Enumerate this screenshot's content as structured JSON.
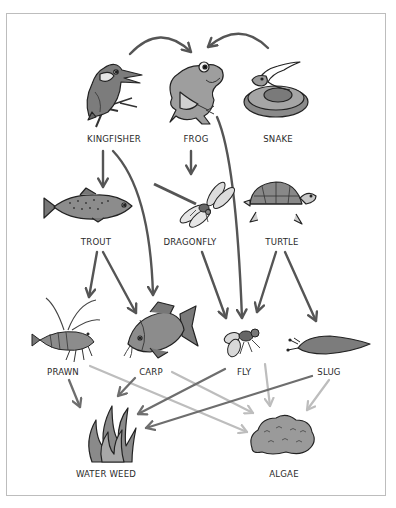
{
  "diagram": {
    "colors": {
      "arrow_dark": "#555555",
      "arrow_mid": "#6e6e6e",
      "arrow_light": "#bdbdbd",
      "border": "#bdbdbd",
      "organism_fill": "#8f8f8f",
      "organism_light": "#c8c8c8",
      "outline": "#222222"
    },
    "nodes": [
      {
        "id": "kingfisher",
        "label": "KINGFISHER",
        "icon": "kingfisher-icon",
        "x": 114,
        "y": 138
      },
      {
        "id": "frog",
        "label": "FROG",
        "icon": "frog-icon",
        "x": 196,
        "y": 138
      },
      {
        "id": "snake",
        "label": "SNAKE",
        "icon": "snake-icon",
        "x": 278,
        "y": 138
      },
      {
        "id": "trout",
        "label": "TROUT",
        "icon": "trout-icon",
        "x": 96,
        "y": 241
      },
      {
        "id": "dragonfly",
        "label": "DRAGONFLY",
        "icon": "dragonfly-icon",
        "x": 190,
        "y": 241
      },
      {
        "id": "turtle",
        "label": "TURTLE",
        "icon": "turtle-icon",
        "x": 282,
        "y": 241
      },
      {
        "id": "prawn",
        "label": "PRAWN",
        "icon": "prawn-icon",
        "x": 63,
        "y": 371
      },
      {
        "id": "carp",
        "label": "CARP",
        "icon": "carp-icon",
        "x": 151,
        "y": 371
      },
      {
        "id": "fly",
        "label": "FLY",
        "icon": "fly-icon",
        "x": 244,
        "y": 371
      },
      {
        "id": "slug",
        "label": "SLUG",
        "icon": "slug-icon",
        "x": 329,
        "y": 371
      },
      {
        "id": "water_weed",
        "label": "WATER WEED",
        "icon": "water-weed-icon",
        "x": 106,
        "y": 473
      },
      {
        "id": "algae",
        "label": "ALGAE",
        "icon": "algae-icon",
        "x": 284,
        "y": 473
      }
    ],
    "edges": [
      {
        "from": "kingfisher",
        "to": "frog",
        "shade": "dark"
      },
      {
        "from": "snake",
        "to": "frog",
        "shade": "dark"
      },
      {
        "from": "kingfisher",
        "to": "trout",
        "shade": "dark"
      },
      {
        "from": "kingfisher",
        "to": "carp",
        "shade": "dark"
      },
      {
        "from": "frog",
        "to": "dragonfly",
        "shade": "dark"
      },
      {
        "from": "frog",
        "to": "fly",
        "shade": "dark"
      },
      {
        "from": "trout",
        "to": "prawn",
        "shade": "dark"
      },
      {
        "from": "trout",
        "to": "carp",
        "shade": "dark"
      },
      {
        "from": "dragonfly",
        "to": "fly",
        "shade": "dark"
      },
      {
        "from": "turtle",
        "to": "fly",
        "shade": "dark"
      },
      {
        "from": "turtle",
        "to": "slug",
        "shade": "dark"
      },
      {
        "from": "prawn",
        "to": "water_weed",
        "shade": "mid"
      },
      {
        "from": "carp",
        "to": "water_weed",
        "shade": "mid"
      },
      {
        "from": "fly",
        "to": "water_weed",
        "shade": "mid"
      },
      {
        "from": "slug",
        "to": "water_weed",
        "shade": "mid"
      },
      {
        "from": "prawn",
        "to": "algae",
        "shade": "light"
      },
      {
        "from": "carp",
        "to": "algae",
        "shade": "light"
      },
      {
        "from": "fly",
        "to": "algae",
        "shade": "light"
      },
      {
        "from": "slug",
        "to": "algae",
        "shade": "light"
      }
    ]
  }
}
